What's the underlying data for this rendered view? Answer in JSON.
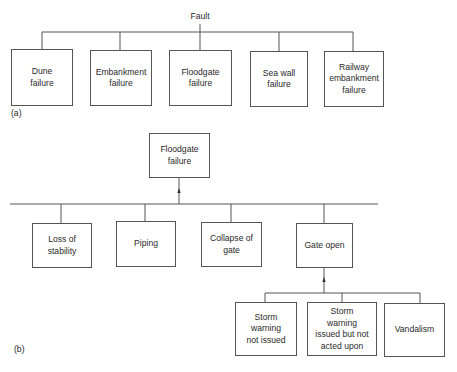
{
  "diagram": {
    "type": "fault-tree",
    "part_a": {
      "caption": "(a)",
      "root": {
        "label": "Fault"
      },
      "children": [
        {
          "id": "dune",
          "label": "Dune\nfailure"
        },
        {
          "id": "embankment",
          "label": "Embankment\nfailure"
        },
        {
          "id": "floodgate",
          "label": "Floodgate\nfailure"
        },
        {
          "id": "seawall",
          "label": "Sea wall\nfailure"
        },
        {
          "id": "railway",
          "label": "Railway\nembankment\nfailure"
        }
      ]
    },
    "part_b": {
      "caption": "(b)",
      "root": {
        "label": "Floodgate\nfailure"
      },
      "children": [
        {
          "id": "stability",
          "label": "Loss of\nstability"
        },
        {
          "id": "piping",
          "label": "Piping"
        },
        {
          "id": "collapse",
          "label": "Collapse of\ngate"
        },
        {
          "id": "gateopen",
          "label": "Gate open",
          "children": [
            {
              "id": "storm-not-issued",
              "label": "Storm\nwarning\nnot issued"
            },
            {
              "id": "storm-not-acted",
              "label": "Storm\nwarning\nissued but not\nacted upon"
            },
            {
              "id": "vandalism",
              "label": "Vandalism"
            }
          ]
        }
      ]
    },
    "colors": {
      "line": "#555555",
      "text": "#2a2a2a",
      "background": "#ffffff"
    }
  }
}
